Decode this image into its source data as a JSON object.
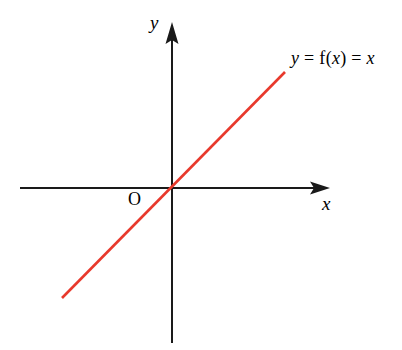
{
  "figure": {
    "background_color": "#ffffff",
    "width": 402,
    "height": 350
  },
  "axes": {
    "color": "#1a1a1a",
    "x_axis": {
      "label": "x",
      "label_style": "italic",
      "start_px": [
        20,
        188
      ],
      "end_px": [
        330,
        188
      ],
      "arrow": "right"
    },
    "y_axis": {
      "label": "y",
      "label_style": "italic",
      "start_px": [
        172,
        343
      ],
      "end_px": [
        172,
        22
      ],
      "arrow": "up"
    },
    "origin_label": "O"
  },
  "function_label": {
    "full_text": "y = f(x) = x",
    "parts": {
      "y": "y",
      "eq1": " = ",
      "f": "f",
      "paren_open": "(",
      "x_arg": "x",
      "paren_close": ")",
      "eq2": " = ",
      "x_rhs": "x"
    }
  },
  "chart_data": {
    "type": "line",
    "title": "",
    "subtitle": "",
    "xlabel": "x",
    "ylabel": "y",
    "legend": [
      "y = f(x) = x"
    ],
    "legend_position": "end-of-line-upper-right",
    "grid": false,
    "axis_style": "arrowed-cartesian-axes-through-origin",
    "xlim": [
      -3.2,
      5.0
    ],
    "ylim": [
      -3.2,
      5.0
    ],
    "xticks": [],
    "yticks": [],
    "annotations": [
      {
        "text": "O",
        "x": -0.55,
        "y": -0.45,
        "note": "origin marker"
      },
      {
        "text": "y = f(x) = x",
        "x": 3.6,
        "y": 3.9,
        "note": "curve label"
      }
    ],
    "series": [
      {
        "name": "y = f(x) = x",
        "color": "#e8392c",
        "line_width_px": 2.6,
        "equation": "y = x",
        "slope": 1,
        "intercept": 0,
        "x": [
          -2.1,
          0,
          2.15
        ],
        "values": [
          -2.1,
          0,
          2.15
        ],
        "pixel_endpoints": [
          [
            62,
            298
          ],
          [
            285,
            72
          ]
        ]
      }
    ]
  },
  "colors": {
    "line": "#e8392c",
    "axis": "#1a1a1a",
    "text": "#000000",
    "background": "#ffffff"
  }
}
